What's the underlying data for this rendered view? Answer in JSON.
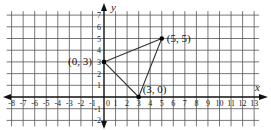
{
  "diagram": {
    "type": "coordinate-plane",
    "axes": {
      "x_label": "x",
      "y_label": "y",
      "x_range": [
        -8,
        13
      ],
      "y_range": [
        -2,
        7
      ],
      "x_ticks": [
        "-8",
        "-7",
        "-6",
        "-5",
        "-4",
        "-3",
        "-2",
        "-1",
        "0",
        "1",
        "2",
        "3",
        "4",
        "5",
        "6",
        "7",
        "8",
        "9",
        "10",
        "11",
        "12",
        "13"
      ],
      "y_ticks": [
        "7",
        "6",
        "5",
        "4",
        "3",
        "2",
        "1",
        "-1",
        "-2"
      ]
    },
    "grid": true,
    "triangle": {
      "vertices": [
        {
          "x": 0,
          "y": 3,
          "label": "(0, 3)"
        },
        {
          "x": 5,
          "y": 5,
          "label": "(5, 5)"
        },
        {
          "x": 3,
          "y": 0,
          "label": "(3, 0)"
        }
      ]
    },
    "colors": {
      "grid": "#555555",
      "axis": "#111111",
      "shape": "#333333"
    }
  }
}
